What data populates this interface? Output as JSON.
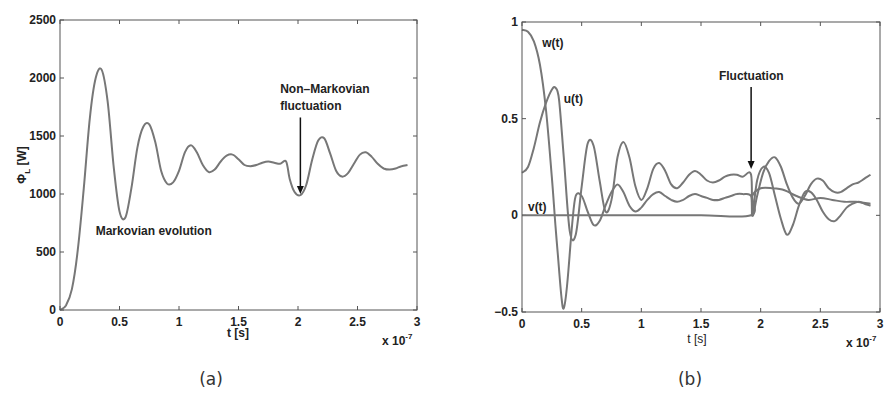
{
  "chart_data": [
    {
      "id": "a",
      "type": "line",
      "title": "",
      "sub_caption": "(a)",
      "xlabel": "t [s]",
      "x_multiplier": "x 10",
      "x_multiplier_exp": "-7",
      "ylabel": "Φ",
      "ylabel_sub": "L",
      "ylabel_unit": " [W]",
      "xlim": [
        0,
        3
      ],
      "ylim": [
        0,
        2500
      ],
      "xticks": [
        "0",
        "0.5",
        "1",
        "1.5",
        "2",
        "2.5",
        "3"
      ],
      "yticks": [
        "0",
        "500",
        "1000",
        "1500",
        "2000",
        "2500"
      ],
      "grid": false,
      "annotations": [
        {
          "text": "Markovian evolution",
          "x": 0.3,
          "y": 650
        },
        {
          "text": "Non–Markovian",
          "x": 1.85,
          "y": 1870
        },
        {
          "text": "fluctuation",
          "x": 1.85,
          "y": 1720,
          "arrow_to": [
            2.02,
            1000
          ]
        }
      ],
      "series": [
        {
          "name": "Phi_L",
          "x": [
            0,
            0.05,
            0.1,
            0.15,
            0.2,
            0.25,
            0.3,
            0.35,
            0.4,
            0.45,
            0.5,
            0.55,
            0.6,
            0.65,
            0.7,
            0.75,
            0.8,
            0.85,
            0.9,
            0.95,
            1.0,
            1.05,
            1.1,
            1.15,
            1.2,
            1.25,
            1.3,
            1.35,
            1.4,
            1.45,
            1.5,
            1.55,
            1.6,
            1.65,
            1.7,
            1.75,
            1.8,
            1.85,
            1.9,
            1.93,
            1.97,
            2.02,
            2.07,
            2.12,
            2.17,
            2.22,
            2.27,
            2.32,
            2.37,
            2.42,
            2.47,
            2.52,
            2.57,
            2.62,
            2.67,
            2.72,
            2.77,
            2.82,
            2.87,
            2.92
          ],
          "y": [
            0,
            40,
            180,
            520,
            1050,
            1650,
            2000,
            2070,
            1800,
            1250,
            850,
            800,
            1050,
            1400,
            1580,
            1600,
            1450,
            1200,
            1090,
            1100,
            1200,
            1360,
            1420,
            1360,
            1250,
            1190,
            1210,
            1280,
            1330,
            1340,
            1300,
            1250,
            1240,
            1250,
            1270,
            1280,
            1270,
            1260,
            1280,
            1130,
            1020,
            990,
            1080,
            1300,
            1460,
            1480,
            1350,
            1200,
            1150,
            1180,
            1260,
            1340,
            1360,
            1320,
            1260,
            1220,
            1210,
            1220,
            1240,
            1250
          ]
        }
      ]
    },
    {
      "id": "b",
      "type": "line",
      "title": "",
      "sub_caption": "(b)",
      "xlabel": "t [s]",
      "x_multiplier": "x 10",
      "x_multiplier_exp": "-7",
      "ylabel": "",
      "xlim": [
        0,
        3
      ],
      "ylim": [
        -0.5,
        1
      ],
      "xticks": [
        "0",
        "0.5",
        "1",
        "1.5",
        "2",
        "2.5",
        "3"
      ],
      "yticks": [
        "-0.5",
        "0",
        "0.5",
        "1"
      ],
      "grid": false,
      "annotations": [
        {
          "text": "w(t)",
          "x": 0.17,
          "y": 0.87
        },
        {
          "text": "u(t)",
          "x": 0.35,
          "y": 0.58
        },
        {
          "text": "v(t)",
          "x": 0.05,
          "y": 0.02
        },
        {
          "text": "Fluctuation",
          "x": 1.65,
          "y": 0.7,
          "arrow_to": [
            1.92,
            0.24
          ]
        }
      ],
      "series": [
        {
          "name": "w(t)",
          "x": [
            0,
            0.05,
            0.1,
            0.15,
            0.2,
            0.25,
            0.28,
            0.3,
            0.33,
            0.35,
            0.38,
            0.42,
            0.45,
            0.5,
            0.55,
            0.6,
            0.65,
            0.7,
            0.75,
            0.8,
            0.85,
            0.9,
            0.95,
            1.0,
            1.05,
            1.1,
            1.15,
            1.2,
            1.25,
            1.3,
            1.35,
            1.4,
            1.45,
            1.5,
            1.55,
            1.6,
            1.65,
            1.7,
            1.75,
            1.8,
            1.85,
            1.92,
            1.93,
            1.97,
            2.02,
            2.07,
            2.12,
            2.17,
            2.22,
            2.27,
            2.32,
            2.37,
            2.42,
            2.47,
            2.52,
            2.57,
            2.62,
            2.67,
            2.72,
            2.77,
            2.82,
            2.87,
            2.92
          ],
          "y": [
            0.96,
            0.95,
            0.9,
            0.78,
            0.55,
            0.2,
            -0.05,
            -0.2,
            -0.42,
            -0.48,
            -0.35,
            -0.05,
            0.1,
            0.1,
            0.02,
            -0.05,
            -0.03,
            0.05,
            0.12,
            0.16,
            0.12,
            0.05,
            0.02,
            0.04,
            0.08,
            0.11,
            0.12,
            0.1,
            0.08,
            0.07,
            0.08,
            0.1,
            0.11,
            0.1,
            0.09,
            0.08,
            0.08,
            0.09,
            0.1,
            0.11,
            0.11,
            0.1,
            0.0,
            0.18,
            0.25,
            0.22,
            0.1,
            -0.02,
            -0.1,
            -0.05,
            0.05,
            0.12,
            0.12,
            0.08,
            0.02,
            -0.02,
            -0.03,
            0.0,
            0.04,
            0.06,
            0.07,
            0.06,
            0.05
          ]
        },
        {
          "name": "u(t)",
          "x": [
            0,
            0.05,
            0.1,
            0.15,
            0.2,
            0.25,
            0.28,
            0.31,
            0.35,
            0.4,
            0.45,
            0.5,
            0.55,
            0.6,
            0.65,
            0.7,
            0.75,
            0.8,
            0.85,
            0.9,
            0.95,
            1.0,
            1.05,
            1.1,
            1.15,
            1.2,
            1.25,
            1.3,
            1.35,
            1.4,
            1.45,
            1.5,
            1.55,
            1.6,
            1.65,
            1.7,
            1.75,
            1.8,
            1.85,
            1.92,
            1.93,
            1.97,
            2.02,
            2.07,
            2.12,
            2.17,
            2.22,
            2.27,
            2.32,
            2.37,
            2.42,
            2.47,
            2.52,
            2.57,
            2.62,
            2.67,
            2.72,
            2.77,
            2.82,
            2.87,
            2.92
          ],
          "y": [
            0.22,
            0.25,
            0.35,
            0.48,
            0.58,
            0.65,
            0.66,
            0.6,
            0.3,
            -0.08,
            -0.1,
            0.15,
            0.37,
            0.36,
            0.18,
            0.02,
            0.08,
            0.3,
            0.38,
            0.3,
            0.15,
            0.08,
            0.14,
            0.24,
            0.27,
            0.23,
            0.16,
            0.14,
            0.17,
            0.21,
            0.23,
            0.21,
            0.18,
            0.17,
            0.18,
            0.2,
            0.21,
            0.21,
            0.2,
            0.21,
            0.0,
            0.1,
            0.22,
            0.28,
            0.3,
            0.25,
            0.16,
            0.09,
            0.06,
            0.1,
            0.16,
            0.19,
            0.18,
            0.14,
            0.12,
            0.12,
            0.14,
            0.16,
            0.17,
            0.19,
            0.21
          ]
        },
        {
          "name": "v(t)",
          "x": [
            0,
            0.5,
            1.0,
            1.5,
            1.92,
            1.93,
            2.0,
            2.1,
            2.2,
            2.3,
            2.4,
            2.5,
            2.6,
            2.7,
            2.8,
            2.92
          ],
          "y": [
            0,
            0,
            0,
            0,
            0,
            0.1,
            0.14,
            0.14,
            0.13,
            0.1,
            0.08,
            0.09,
            0.08,
            0.07,
            0.07,
            0.06
          ]
        }
      ]
    }
  ],
  "caption_partial": ""
}
